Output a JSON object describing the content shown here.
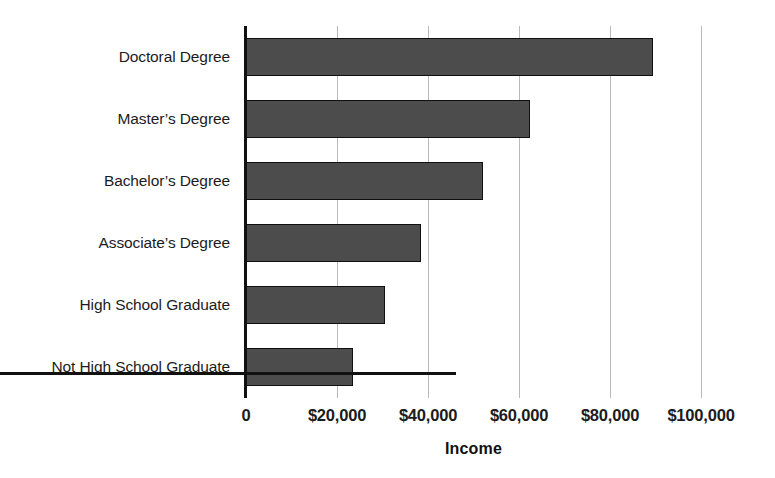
{
  "chart_data": {
    "type": "bar",
    "orientation": "horizontal",
    "title": "",
    "xlabel": "Income",
    "ylabel": "",
    "categories": [
      "Doctoral Degree",
      "Master’s Degree",
      "Bachelor’s Degree",
      "Associate’s Degree",
      "High School Graduate",
      "Not High School Graduate"
    ],
    "values": [
      89500,
      62500,
      52000,
      38500,
      30500,
      23500
    ],
    "xlim": [
      0,
      100000
    ],
    "xticks": [
      0,
      20000,
      40000,
      60000,
      80000,
      100000
    ],
    "xtick_labels": [
      "0",
      "$20,000",
      "$40,000",
      "$60,000",
      "$80,000",
      "$100,000"
    ],
    "grid": true,
    "grid_axis": "x",
    "legend": false,
    "bar_color": "#4c4c4c",
    "bar_edge_color": "#101010",
    "grid_color": "#b9b9b9",
    "axis_color": "#111111",
    "background": "#ffffff"
  }
}
